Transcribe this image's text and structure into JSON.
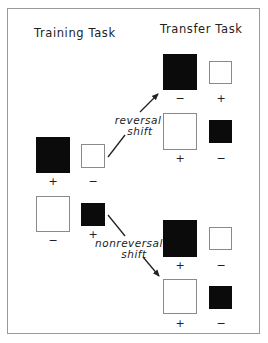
{
  "headings": {
    "training": "Training Task",
    "transfer": "Transfer Task"
  },
  "arrows": {
    "reversal": {
      "line1": "reversal",
      "line2": "shift"
    },
    "nonreversal": {
      "line1": "nonreversal",
      "line2": "shift"
    }
  },
  "training": [
    {
      "large": {
        "fill": "black",
        "sign": "+"
      },
      "small": {
        "fill": "white",
        "sign": "−"
      }
    },
    {
      "large": {
        "fill": "white",
        "sign": "−"
      },
      "small": {
        "fill": "black",
        "sign": "+"
      }
    }
  ],
  "transfer_reversal": [
    {
      "large": {
        "fill": "black",
        "sign": "−"
      },
      "small": {
        "fill": "white",
        "sign": "+"
      }
    },
    {
      "large": {
        "fill": "white",
        "sign": "+"
      },
      "small": {
        "fill": "black",
        "sign": "−"
      }
    }
  ],
  "transfer_nonreversal": [
    {
      "large": {
        "fill": "black",
        "sign": "+"
      },
      "small": {
        "fill": "white",
        "sign": "−"
      }
    },
    {
      "large": {
        "fill": "white",
        "sign": "+"
      },
      "small": {
        "fill": "black",
        "sign": "−"
      }
    }
  ],
  "colors": {
    "black": "#0b0b0b",
    "white": "#ffffff",
    "line": "#222222"
  }
}
